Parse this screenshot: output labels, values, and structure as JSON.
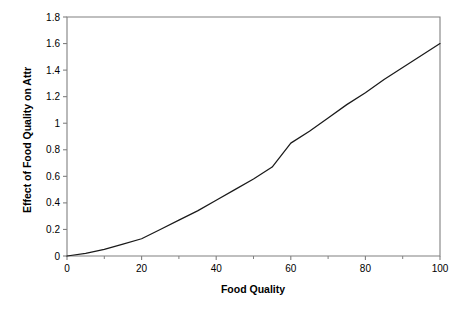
{
  "chart_data": {
    "type": "line",
    "title": "",
    "subtitle": "",
    "xlabel": "Food Quality",
    "ylabel": "Effect of Food Quality on Attr",
    "xlim": [
      0,
      100
    ],
    "ylim": [
      0,
      1.8
    ],
    "grid": false,
    "legend": null,
    "legend_position": "none",
    "x_ticks": [
      0,
      20,
      40,
      60,
      80,
      100
    ],
    "x_tick_labels": [
      "0",
      "20",
      "40",
      "60",
      "80",
      "100"
    ],
    "x_minor_ticks": [
      10,
      30,
      50,
      70,
      90
    ],
    "y_ticks": [
      0,
      0.2,
      0.4,
      0.6,
      0.8,
      1.0,
      1.2,
      1.4,
      1.6,
      1.8
    ],
    "y_tick_labels": [
      "0",
      "0.2",
      "0.4",
      "0.6",
      "0.8",
      "1",
      "1.2",
      "1.4",
      "1.6",
      "1.8"
    ],
    "series": [
      {
        "name": "Effect of Food Quality on Attr",
        "color": "#1a1a1a",
        "x": [
          0,
          5,
          10,
          15,
          20,
          25,
          30,
          35,
          40,
          45,
          50,
          55,
          60,
          65,
          70,
          75,
          80,
          85,
          90,
          95,
          100
        ],
        "values": [
          0.0,
          0.02,
          0.05,
          0.09,
          0.13,
          0.2,
          0.27,
          0.34,
          0.42,
          0.5,
          0.58,
          0.67,
          0.85,
          0.94,
          1.04,
          1.14,
          1.23,
          1.33,
          1.42,
          1.51,
          1.6
        ]
      }
    ]
  },
  "axes": {
    "x_title": "Food Quality",
    "y_title": "Effect of Food Quality on Attr"
  },
  "colors": {
    "line": "#1a1a1a",
    "frame": "#808080",
    "background": "#ffffff"
  }
}
